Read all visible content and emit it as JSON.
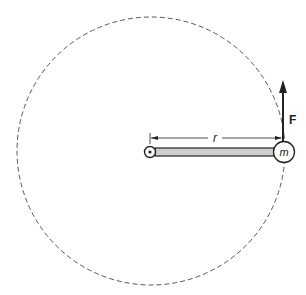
{
  "diagram": {
    "labels": {
      "radius": "r",
      "mass": "m",
      "force": "F"
    },
    "colors": {
      "stroke": "#222222",
      "rod_fill": "#cfcfcf",
      "orbit_dash": "#444444",
      "background": "#ffffff"
    }
  }
}
